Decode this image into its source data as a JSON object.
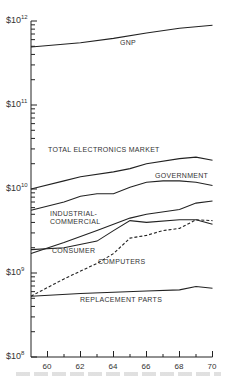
{
  "chart_data": {
    "type": "line",
    "title": "",
    "xlabel": "",
    "ylabel": "",
    "yscale": "log",
    "ylim": [
      100000000.0,
      1000000000000.0
    ],
    "xlim": [
      1959,
      1970
    ],
    "grid": false,
    "legend": "inline labels",
    "y_ticks": [
      {
        "value": 1000000000000.0,
        "label": "$10",
        "exp": "12"
      },
      {
        "value": 100000000000.0,
        "label": "$10",
        "exp": "11"
      },
      {
        "value": 10000000000.0,
        "label": "$10",
        "exp": "10"
      },
      {
        "value": 1000000000.0,
        "label": "$10",
        "exp": "9"
      },
      {
        "value": 100000000.0,
        "label": "$10",
        "exp": "8"
      }
    ],
    "x_ticks": [
      {
        "value": 1960,
        "label": "60"
      },
      {
        "value": 1962,
        "label": "62"
      },
      {
        "value": 1964,
        "label": "64"
      },
      {
        "value": 1966,
        "label": "66"
      },
      {
        "value": 1968,
        "label": "68"
      },
      {
        "value": 1970,
        "label": "70"
      }
    ],
    "series": [
      {
        "name": "GNP",
        "style": "solid",
        "x": [
          1959,
          1962,
          1964,
          1966,
          1968,
          1970
        ],
        "values": [
          490000000000.0,
          550000000000.0,
          620000000000.0,
          720000000000.0,
          820000000000.0,
          890000000000.0
        ]
      },
      {
        "name": "TOTAL ELECTRONICS MARKET",
        "style": "solid",
        "x": [
          1959,
          1961,
          1962,
          1964,
          1965,
          1966,
          1968,
          1969,
          1970
        ],
        "values": [
          10000000000.0,
          12500000000.0,
          14000000000.0,
          16000000000.0,
          17500000000.0,
          20000000000.0,
          23000000000.0,
          24000000000.0,
          22000000000.0
        ]
      },
      {
        "name": "GOVERNMENT",
        "style": "solid",
        "x": [
          1959,
          1961,
          1962,
          1963,
          1964,
          1965,
          1966,
          1967,
          1968,
          1969,
          1970
        ],
        "values": [
          5600000000.0,
          7000000000.0,
          8200000000.0,
          8800000000.0,
          8800000000.0,
          10500000000.0,
          12000000000.0,
          12500000000.0,
          12500000000.0,
          12000000000.0,
          11000000000.0
        ]
      },
      {
        "name": "INDUSTRIAL-COMMERCIAL",
        "style": "solid",
        "x": [
          1959,
          1961,
          1963,
          1965,
          1966,
          1968,
          1969,
          1970
        ],
        "values": [
          1700000000.0,
          2300000000.0,
          3200000000.0,
          4500000000.0,
          5000000000.0,
          5700000000.0,
          6800000000.0,
          7200000000.0
        ]
      },
      {
        "name": "CONSUMER",
        "style": "solid",
        "x": [
          1959,
          1961,
          1963,
          1964,
          1965,
          1966,
          1968,
          1969,
          1970
        ],
        "values": [
          1900000000.0,
          2000000000.0,
          2400000000.0,
          3200000000.0,
          4200000000.0,
          4000000000.0,
          4300000000.0,
          4300000000.0,
          3800000000.0
        ]
      },
      {
        "name": "COMPUTERS",
        "style": "dashed",
        "x": [
          1959,
          1961,
          1963,
          1964,
          1965,
          1966,
          1967,
          1968,
          1969,
          1970
        ],
        "values": [
          530000000.0,
          850000000.0,
          1300000000.0,
          1700000000.0,
          2600000000.0,
          2800000000.0,
          3200000000.0,
          3400000000.0,
          4300000000.0,
          4200000000.0
        ]
      },
      {
        "name": "REPLACEMENT PARTS",
        "style": "solid",
        "x": [
          1959,
          1962,
          1964,
          1966,
          1968,
          1969,
          1970
        ],
        "values": [
          530000000.0,
          570000000.0,
          590000000.0,
          610000000.0,
          630000000.0,
          690000000.0,
          660000000.0
        ]
      }
    ]
  },
  "labels": {
    "gnp": "GNP",
    "total": "TOTAL ELECTRONICS MARKET",
    "government": "GOVERNMENT",
    "industrial_1": "INDUSTRIAL-",
    "industrial_2": "COMMERCIAL",
    "consumer": "CONSUMER",
    "computers": "COMPUTERS",
    "replacement": "REPLACEMENT PARTS"
  }
}
